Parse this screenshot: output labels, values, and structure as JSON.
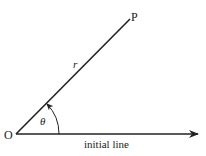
{
  "diagram": {
    "type": "polar-coordinates",
    "labels": {
      "origin": "O",
      "point": "P",
      "radius": "r",
      "angle": "θ",
      "initial_line": "initial line"
    },
    "colors": {
      "line": "#222222",
      "background": "#ffffff"
    },
    "geometry": {
      "origin": [
        16,
        134
      ],
      "point_p": [
        130,
        18
      ],
      "initial_line_end": [
        199,
        134
      ],
      "arc_radius": 43
    }
  }
}
